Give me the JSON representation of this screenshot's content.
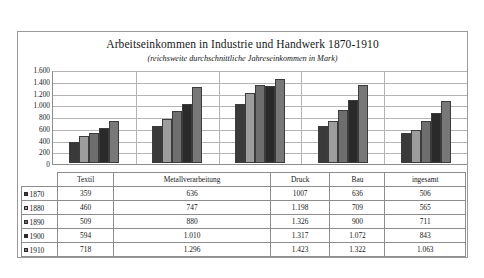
{
  "chart_data": {
    "type": "bar",
    "title": "Arbeitseinkommen in Industrie und Handwerk 1870-1910",
    "subtitle": "(reichsweite durchschnittliche Jahreseinkommen in Mark)",
    "xlabel": "",
    "ylabel": "",
    "ylim": [
      0,
      1600
    ],
    "ystep": 200,
    "grid": true,
    "legend_position": "table-below",
    "categories": [
      "Textil",
      "Metallverarbeitung",
      "Druck",
      "Bau",
      "ingesamt"
    ],
    "ytick_labels": [
      "1.600",
      "1.400",
      "1.200",
      "1.000",
      "800",
      "600",
      "400",
      "200",
      "0"
    ],
    "ytick_values": [
      1600,
      1400,
      1200,
      1000,
      800,
      600,
      400,
      200,
      0
    ],
    "series": [
      {
        "name": "1870",
        "color": "#3a3a3a",
        "values": [
          359,
          636,
          1007,
          636,
          506
        ],
        "labels": [
          "359",
          "636",
          "1007",
          "636",
          "506"
        ]
      },
      {
        "name": "1880",
        "color": "#9d9d9d",
        "values": [
          460,
          747,
          1198,
          709,
          565
        ],
        "labels": [
          "460",
          "747",
          "1.198",
          "709",
          "565"
        ]
      },
      {
        "name": "1890",
        "color": "#6e6e6e",
        "values": [
          509,
          880,
          1326,
          900,
          711
        ],
        "labels": [
          "509",
          "880",
          "1.326",
          "900",
          "711"
        ]
      },
      {
        "name": "1900",
        "color": "#2a2a2a",
        "values": [
          594,
          1010,
          1317,
          1072,
          843
        ],
        "labels": [
          "594",
          "1.010",
          "1.317",
          "1.072",
          "843"
        ]
      },
      {
        "name": "1910",
        "color": "#787878",
        "values": [
          718,
          1296,
          1423,
          1322,
          1063
        ],
        "labels": [
          "718",
          "1.296",
          "1.423",
          "1.322",
          "1.063"
        ]
      }
    ]
  },
  "table": {
    "corner_label": "",
    "column_headers": [
      "Textil",
      "Metallverarbeitung",
      "Druck",
      "Bau",
      "ingesamt"
    ],
    "rows": [
      {
        "year": "1870",
        "cells": [
          "359",
          "636",
          "1007",
          "636",
          "506"
        ]
      },
      {
        "year": "1880",
        "cells": [
          "460",
          "747",
          "1.198",
          "709",
          "565"
        ]
      },
      {
        "year": "1890",
        "cells": [
          "509",
          "880",
          "1.326",
          "900",
          "711"
        ]
      },
      {
        "year": "1900",
        "cells": [
          "594",
          "1.010",
          "1.317",
          "1.072",
          "843"
        ]
      },
      {
        "year": "1910",
        "cells": [
          "718",
          "1.296",
          "1.423",
          "1.322",
          "1.063"
        ]
      }
    ]
  }
}
